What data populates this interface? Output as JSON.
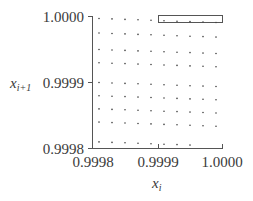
{
  "chart_data": {
    "type": "scatter",
    "title": "",
    "xlabel": "x_i",
    "ylabel": "x_{i+1}",
    "xlabel_main": "x",
    "xlabel_sub": "i",
    "ylabel_main": "x",
    "ylabel_sub": "i+1",
    "xlim": [
      0.9998,
      1.0
    ],
    "ylim": [
      0.9998,
      1.0
    ],
    "x_ticks": [
      "0.9998",
      "0.9999",
      "1.0000"
    ],
    "y_ticks": [
      "0.9998",
      "0.9999",
      "1.0000"
    ],
    "grid": false,
    "legend": null,
    "annotations": [
      {
        "type": "rectangle",
        "x_range": [
          0.9999,
          1.0
        ],
        "y_range": [
          0.99999,
          1.0
        ],
        "description": "empty highlighted box at top-right"
      }
    ],
    "points_description": "Lattice of points arranged in ~9 rows x 10 columns, slightly sheared downward toward the right; bottom row converges toward the x-axis near x=0.99995.",
    "series": [
      {
        "name": "lattice points",
        "rows": [
          {
            "y": 0.999997,
            "x": [
              0.99981,
              0.99983,
              0.99985,
              0.99987,
              0.99989,
              0.99991,
              0.99993,
              0.99995,
              0.99997,
              0.99999
            ]
          },
          {
            "y": 0.999975,
            "x": [
              0.99981,
              0.99983,
              0.99985,
              0.99987,
              0.99989,
              0.99991,
              0.99993,
              0.99995,
              0.99997,
              0.99999
            ]
          },
          {
            "y": 0.99995,
            "x": [
              0.99981,
              0.99983,
              0.99985,
              0.99987,
              0.99989,
              0.99991,
              0.99993,
              0.99995,
              0.99997,
              0.99999
            ]
          },
          {
            "y": 0.99993,
            "x": [
              0.99981,
              0.99983,
              0.99985,
              0.99987,
              0.99989,
              0.99991,
              0.99993,
              0.99995,
              0.99997,
              0.99999
            ]
          },
          {
            "y": 0.9999,
            "x": [
              0.99981,
              0.99983,
              0.99985,
              0.99987,
              0.99989,
              0.99991,
              0.99993,
              0.99995,
              0.99997,
              0.99999
            ]
          },
          {
            "y": 0.99988,
            "x": [
              0.99981,
              0.99983,
              0.99985,
              0.99987,
              0.99989,
              0.99991,
              0.99993,
              0.99995,
              0.99997,
              0.99999
            ]
          },
          {
            "y": 0.99986,
            "x": [
              0.99981,
              0.99983,
              0.99985,
              0.99987,
              0.99989,
              0.99991,
              0.99993,
              0.99995,
              0.99997,
              0.99999
            ]
          },
          {
            "y": 0.99984,
            "x": [
              0.99981,
              0.99983,
              0.99985,
              0.99987,
              0.99989,
              0.99991,
              0.99993,
              0.99995,
              0.99997,
              0.99999
            ]
          },
          {
            "y": 0.99981,
            "x": [
              0.99981,
              0.99983,
              0.99985,
              0.99987,
              0.99989,
              0.99991,
              0.99993,
              0.99995
            ]
          }
        ]
      }
    ]
  },
  "colors": {
    "axis": "#555555",
    "points": "#444444",
    "text": "#3a3a3a"
  }
}
